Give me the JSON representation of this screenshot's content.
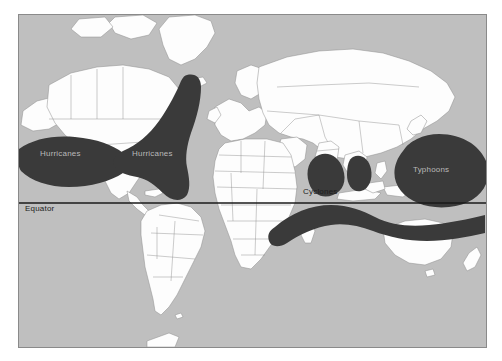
{
  "figure": {
    "kind": "world-map",
    "frame": {
      "x": 18,
      "y": 14,
      "width": 469,
      "height": 334
    },
    "colors": {
      "page_background": "#ffffff",
      "ocean": "#bfbfbf",
      "land": "#fdfdfd",
      "land_border": "#8d8d8d",
      "cyclone_zone": "#3a3a3a",
      "frame_border": "#8a8a8a",
      "equator_line": "#1a1a1a",
      "label_on_dark": "#b9b9b9",
      "label_on_light": "#1d1d1d"
    }
  },
  "equator": {
    "label": "Equator",
    "label_x": 24,
    "label_y": 207,
    "line_y": 202
  },
  "zones": [
    {
      "id": "east-pacific-hurricanes",
      "label": "Hurricanes",
      "label_x": 39,
      "label_y": 152,
      "label_tone": "dark"
    },
    {
      "id": "north-atlantic-hurricanes",
      "label": "Hurricanes",
      "label_x": 131,
      "label_y": 152,
      "label_tone": "dark"
    },
    {
      "id": "north-indian-cyclones",
      "label": "Cyclones",
      "label_x": 302,
      "label_y": 190,
      "label_tone": "light"
    },
    {
      "id": "northwest-pacific-typhoons",
      "label": "Typhoons",
      "label_x": 412,
      "label_y": 168,
      "label_tone": "dark"
    }
  ],
  "legend_note": {
    "zone_names": [
      "Hurricanes",
      "Hurricanes",
      "Cyclones",
      "Typhoons"
    ],
    "reference_line": "Equator"
  }
}
